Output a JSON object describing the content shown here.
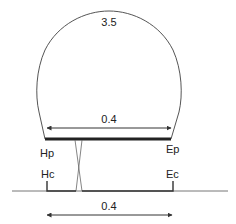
{
  "diagram": {
    "loop_label": "3.5",
    "top_span_label": "0.4",
    "bottom_span_label": "0.4",
    "points": {
      "hp": "Hp",
      "ep": "Ep",
      "hc": "Hc",
      "ec": "Ec"
    },
    "colors": {
      "line": "#555555",
      "thick_bar": "#222222",
      "text": "#222222",
      "background": "#ffffff"
    }
  }
}
